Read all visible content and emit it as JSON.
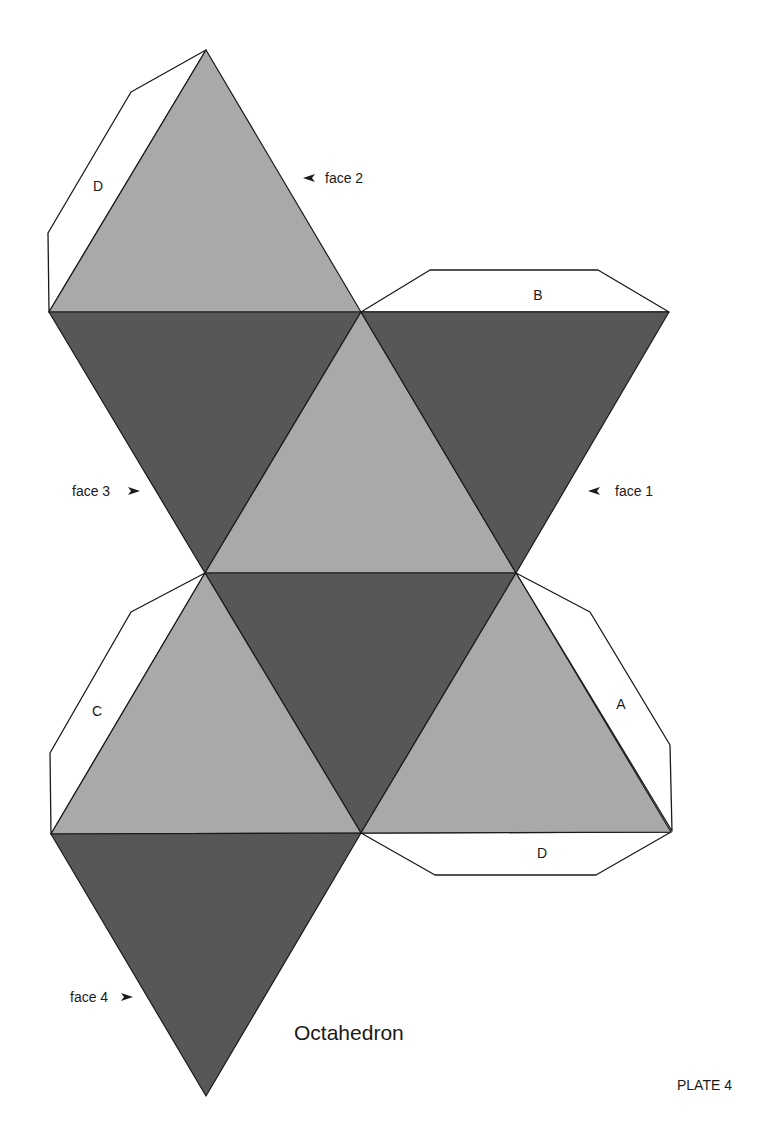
{
  "title": "Octahedron",
  "plate": "PLATE 4",
  "colors": {
    "light_face": "#a9a9a9",
    "dark_face": "#575757",
    "tab_fill": "#ffffff",
    "edge": "#1a1a1a"
  },
  "face_labels": [
    {
      "id": "face2",
      "text": "face 2",
      "arrow": "left"
    },
    {
      "id": "face3",
      "text": "face 3",
      "arrow": "right"
    },
    {
      "id": "face1",
      "text": "face 1",
      "arrow": "left"
    },
    {
      "id": "face4",
      "text": "face 4",
      "arrow": "right"
    }
  ],
  "tabs": [
    {
      "id": "tab-d-top",
      "letter": "D"
    },
    {
      "id": "tab-b",
      "letter": "B"
    },
    {
      "id": "tab-c",
      "letter": "C"
    },
    {
      "id": "tab-a",
      "letter": "A"
    },
    {
      "id": "tab-d-bottom",
      "letter": "D"
    }
  ]
}
